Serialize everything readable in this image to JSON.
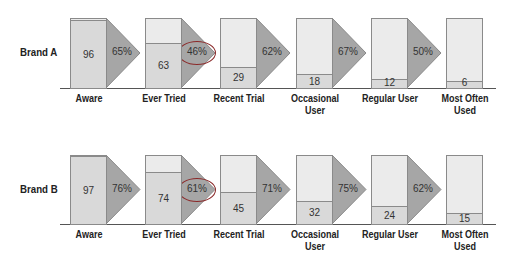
{
  "chart_data": {
    "type": "bar",
    "title": "",
    "subtype": "funnel / conversion chart",
    "categories": [
      "Aware",
      "Ever Tried",
      "Recent Trial",
      "Occasional User",
      "Regular User",
      "Most Often Used"
    ],
    "series": [
      {
        "name": "Brand A",
        "values": [
          96,
          63,
          29,
          18,
          12,
          6
        ],
        "conversions": [
          "65%",
          "46%",
          "62%",
          "67%",
          "50%"
        ],
        "highlighted_conversion_index": 1
      },
      {
        "name": "Brand B",
        "values": [
          97,
          74,
          45,
          32,
          24,
          15
        ],
        "conversions": [
          "76%",
          "61%",
          "71%",
          "75%",
          "62%"
        ],
        "highlighted_conversion_index": 1
      }
    ],
    "ylim": [
      0,
      100
    ],
    "xlabel": "",
    "ylabel": "",
    "grid": false,
    "legend": "row labels at left"
  },
  "rows": [
    {
      "label": "Brand A",
      "values": [
        "96",
        "63",
        "29",
        "18",
        "12",
        "6"
      ],
      "conv": [
        "65%",
        "46%",
        "62%",
        "67%",
        "50%"
      ]
    },
    {
      "label": "Brand B",
      "values": [
        "97",
        "74",
        "45",
        "32",
        "24",
        "15"
      ],
      "conv": [
        "76%",
        "61%",
        "71%",
        "75%",
        "62%"
      ]
    }
  ],
  "stages": [
    {
      "line1": "Aware",
      "line2": ""
    },
    {
      "line1": "Ever Tried",
      "line2": ""
    },
    {
      "line1": "Recent Trial",
      "line2": ""
    },
    {
      "line1": "Occasional",
      "line2": "User"
    },
    {
      "line1": "Regular User",
      "line2": ""
    },
    {
      "line1": "Most Often",
      "line2": "Used"
    }
  ],
  "colors": {
    "bar_empty": "#ebebeb",
    "bar_fill": "#d9d9d9",
    "arrow": "#a6a6a6",
    "highlight_ring": "#8b2a2a"
  }
}
